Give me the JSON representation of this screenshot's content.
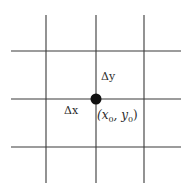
{
  "diagram": {
    "type": "grid-point",
    "grid": {
      "vertical_lines_x": [
        46,
        96,
        144
      ],
      "horizontal_lines_y": [
        51,
        99,
        147
      ],
      "vertical_extent": [
        15,
        183
      ],
      "horizontal_extent": [
        11,
        181
      ],
      "line_color": "#3a3a3a"
    },
    "point": {
      "x": 96,
      "y": 99,
      "radius": 5.5,
      "color": "#111111",
      "label_main": "(x",
      "label_sub_x": "0",
      "label_mid": ", y",
      "label_sub_y": "0",
      "label_close": ")"
    },
    "labels": {
      "delta_x": "Δx",
      "delta_y": "Δy"
    }
  }
}
